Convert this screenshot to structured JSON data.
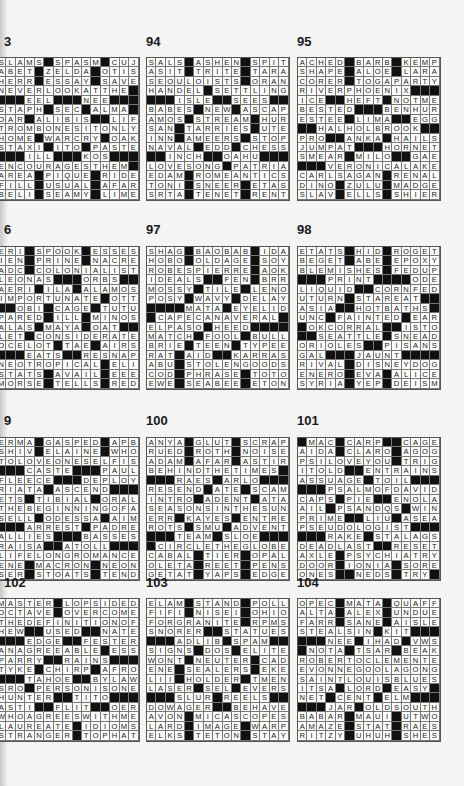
{
  "page": {
    "background": "#f4f4f2",
    "black_square_color": "#111111"
  },
  "puzzles": [
    {
      "number": "93",
      "label": "3",
      "col": 0,
      "row": 0,
      "grid": [
        "SLAMS#SPASM#CUJO",
        "ABET#ZELDA#OTIS",
        "HERR#ESSAY#SAVE",
        "NEVERLOOKATTHE#",
        "###EEL###NEE###",
        "STAPH#SEC#ALMA#",
        "OAR#ALIBIS##LIFT",
        "TROMBONESITONLY",
        "HOME#WARCRY#OAK",
        "STAXI#ITO#PASTE",
        "###ILL###KOS###",
        "ENCOURAGESTHEM#",
        "AREA#PIQUE#RIDE",
        "FILL#USUAL#AFAR",
        "BELI#SEAMY#LIME"
      ]
    },
    {
      "number": "94",
      "label": "94",
      "col": 1,
      "row": 0,
      "grid": [
        "SALS#ASHEN#SPIT",
        "ASIT#TRITE#TARA",
        "SEOULOISTS#ORAN",
        "HANDEL#SETTLING",
        "###ISLE##SEES###",
        "BABES#NEW#ASCAP",
        "AMOS#STREAM#HUR",
        "SAN#TARRIES#UTE",
        "INN#AMEERS#STOP",
        "NAVAL#EDD#CHESS",
        "##INCH##OAHU###",
        "LOVESONG#PATRIA",
        "EDAM#ROMEANTICS",
        "TONI#SNEER#ETAS",
        "SRTA#TENET#RENT"
      ]
    },
    {
      "number": "95",
      "label": "95",
      "col": 2,
      "row": 0,
      "grid": [
        "ACHED#BARB#KEMP",
        "SHAPE#ALOE#LARA",
        "CORER#TOGAPARTY",
        "RIVERPHOENIX###",
        "ICE##HEFT#NOTME",
        "BESTED###BENHUR",
        "ESTEE#LIMA##EGG",
        "##HALHOLBROOK##",
        "PRO##ANKA#HAILS",
        "JUMPAT###HORNET",
        "SMEAR#MILO##GAE",
        "###VERONICALAKE",
        "CARLSAGAN#RENAL",
        "DINO#ZULU#MADGE",
        "SLAV#ELLS#SHIER"
      ]
    },
    {
      "number": "96",
      "label": "6",
      "col": 0,
      "row": 1,
      "grid": [
        "ERI#SPOOK#ESSES",
        "IEN#PRINE#NACRE",
        "ADC#COLONIALIST",
        "LEONAS###ORBS###",
        "AERI#ILA#ALAMOS",
        "IMPORTUNATE#OTT",
        "##OBI#CAGE#TUTU",
        "PARED#ILL#MINOS",
        "ALAS#MAYA#OAT##",
        "LET#CONSIDERATE",
        "OCELOT#TAE#AIRS",
        "###EATS##RESNAP",
        "NEOTROPICAL#ELI",
        "STATS#AVAIL#EEE",
        "MORSE#TELLS#RED"
      ]
    },
    {
      "number": "97",
      "label": "97",
      "col": 1,
      "row": 1,
      "grid": [
        "SHAG#BAOBAB#IDA",
        "HOBO#OLDAGE#SOY",
        "ROBESPIERRE#AOK",
        "IDEALS##FEN#BRR",
        "MOSSY#TILE#LENO",
        "POSY#WAVY#DELAY",
        "####MATA#EYELID",
        "#CAPECANAVERAL#",
        "ELPASO#HEED####",
        "MATCH#FOOL#BULL",
        "BRIE#TEEN#TYPEE",
        "RAT#AID##KARRAS",
        "ABU#STOLENGOODS",
        "COD#PHRASE#TOTO",
        "EWE#SEABEE#ETON"
      ]
    },
    {
      "number": "98",
      "label": "98",
      "col": 2,
      "row": 1,
      "grid": [
        "ETATS#HID#ROGET",
        "BEGET#ABE#EPOXY",
        "BLEMISHES#FEDUP",
        "###PRINT####ODE",
        "LIQUID##CORNFED",
        "UTURN#STAREAT##",
        "ASIA##HOTBATHS#",
        "UNC#FAINTED#EAR",
        "#OKCORRAL##ISTO",
        "##SEATTLE#SNEAD",
        "ORIOLES##PISANS",
        "GAL###JAUNT####",
        "RIVAL#DISNEYDOG",
        "ENERO#EVA#ALICE",
        "SYRIA#YEP#DEISM"
      ]
    },
    {
      "number": "99",
      "label": "9",
      "col": 0,
      "row": 2,
      "grid": [
        "ERMA#GASPED#APB",
        "SHIV#ELAINE#WHO",
        "TOLOVEONESELFIS",
        "###CASTE###PAULS",
        "FLEECE###DEPLOY",
        "RIATA#ASCEND###",
        "ETS#TIBIAL#ORAL",
        "THEBEGINNINGOFA",
        "SELL#ODESSA#AIM",
        "###ARREST#PADRE",
        "ALLIES###BASSES",
        "RAISA##ATOLL###",
        "LIFELONGROMANCE",
        "ENE#MACRON#NEON",
        "SER#STOATS#TEND"
      ]
    },
    {
      "number": "100",
      "label": "100",
      "col": 1,
      "row": 2,
      "grid": [
        "ANYA#GLUT#SCRAP",
        "RUED#ROTH#NOISE",
        "ADAM#AFAR#ASTIR",
        "BEHINDTHETIMES#",
        "###RAES#ARLO###",
        "RESEND#ATE#SCAM",
        "INTRO#ADENT#ATA",
        "SEASONSINTHESUN",
        "ERR#KAYES#ENTRE",
        "ROTS#SMU#ADVENT",
        "###TEAM#SLOE###",
        "#CIRCLETHEGLOBE",
        "CABAL#TIER#OPAL",
        "OLETA#REET#PENS",
        "GETAT#YAPS#EDGE"
      ]
    },
    {
      "number": "101",
      "label": "101",
      "col": 2,
      "row": 2,
      "grid": [
        "#MAC#CARP##CAGE",
        "AIDA#CLARO#AGOG",
        "PSILOVEYOU#TRIG",
        "ITOLD##ENTRAINS",
        "ASSUAGE#TOIL###",
        "###PSALMOFDAVID",
        "CAPS#PIE##ENOLA",
        "AIL#PSANDQS#WIN",
        "PRIME##LIU#ASEA",
        "PSEUDOLOGIST###",
        "###RAKE#STALAGS",
        "DEADLAST##RESET",
        "AXLE#PSYCHIATRY",
        "DOOR#IONIA#SORE",
        "ONES##NEDS#TRY#"
      ]
    },
    {
      "number": "102",
      "label": "102",
      "col": 0,
      "row": 3,
      "grid": [
        "MASTER#LOPSIDED",
        "OCTAVE#OVERCOME",
        "THEDEFINITIONOF",
        "HEW##USED##NATE",
        "###EDGE##FESTER",
        "ANAGREEABLE#ESS",
        "PARRY##RAINS###",
        "TYKE#CHIRP#AFRO",
        "###TAHOE##BYLAW",
        "SRO#PERSONISONE",
        "HUNTER##TITO###",
        "ASTI##FLIT##OER",
        "WHOAGREESWITHME",
        "LAUREATE#IDIOMS",
        "STRANGER#TOPHAT"
      ]
    },
    {
      "number": "103",
      "label": "103",
      "col": 1,
      "row": 3,
      "grid": [
        "ELAM#STAND#POLL",
        "FIFI#NISEI#OHIO",
        "FORGRANITE#RPMS",
        "SNORER##STATUES",
        "###ADLIB#SPAM###",
        "SIGNS#DOS#ELITE",
        "WONT#NEUTER#CAD",
        "ENE#SEALERS#EKE",
        "LII#HOLDER#TMEN",
        "LASER#SEL#EVERS",
        "###SLUR#REELS###",
        "DOWAGER##BEHAVE",
        "AVON#MICASCOPES",
        "LARD#IMAGE#WARP",
        "ELKS#TETON#STAY"
      ]
    },
    {
      "number": "104",
      "label": "104",
      "col": 2,
      "row": 3,
      "grid": [
        "OPEC#MATA#QUAFF",
        "ALTA#ALEX#UNDUE",
        "FARR#SANE#AISLE",
        "STEALSIN#KIT###",
        "###NEE#IHAD#VWS",
        "#NOTA#TSAR#BEAK",
        "ROBERTOCLEMENTE",
        "EVONNEGOOLAGONG",
        "SAINTLOUISBLUES",
        "ITSA#LORD#EASY#",
        "NET#CENT#ELM###",
        "###JAR#OLDSOUTH",
        "BABAR#MAUI#UTWO",
        "AMAZE#STAT#RAES",
        "RITZY#UHUH#SHES"
      ]
    }
  ]
}
